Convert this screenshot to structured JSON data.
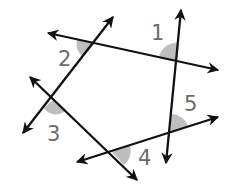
{
  "diagram": {
    "angle_labels": [
      "1",
      "2",
      "3",
      "4",
      "5"
    ],
    "colors": {
      "line": "#111111",
      "label": "#6b6b6b",
      "shade": "#777777"
    }
  }
}
